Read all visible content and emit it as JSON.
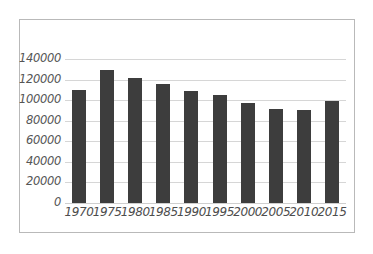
{
  "chart_data": {
    "type": "bar",
    "title": "",
    "subtitle": "",
    "xlabel": "",
    "ylabel": "",
    "categories": [
      "1970",
      "1975",
      "1980",
      "1985",
      "1990",
      "1995",
      "2000",
      "2005",
      "2010",
      "2015"
    ],
    "values": [
      110000,
      129000,
      122000,
      116000,
      109000,
      105500,
      97600,
      91500,
      90600,
      99400
    ],
    "series": [
      {
        "name": "",
        "values": [
          110000,
          129000,
          122000,
          116000,
          109000,
          105500,
          97600,
          91500,
          90600,
          99400
        ]
      }
    ],
    "ylim": [
      0,
      140000
    ],
    "ytick_labels": [
      "0",
      "20000",
      "40000",
      "60000",
      "80000",
      "100000",
      "120000",
      "140000"
    ],
    "ytick_values": [
      0,
      20000,
      40000,
      60000,
      80000,
      100000,
      120000,
      140000
    ],
    "xtick_labels": [
      "1970",
      "1975",
      "1980",
      "1985",
      "1990",
      "1995",
      "2000",
      "2005",
      "2010",
      "2015"
    ],
    "grid": true,
    "grid_axis": "y",
    "legend": false,
    "legend_position": "none",
    "bar_color": "#3d3d3d",
    "gridline_color": "#d6d6d6",
    "axis_text_color": "#4d4d4d",
    "frame_border_color": "#b9b9b9",
    "background_color": "#ffffff",
    "annotations": []
  }
}
